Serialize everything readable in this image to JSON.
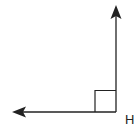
{
  "diagram": {
    "type": "right-angle",
    "vertex_label": "H",
    "vertex": [
      116,
      112
    ],
    "rays": [
      {
        "name": "up",
        "end": [
          116,
          5
        ]
      },
      {
        "name": "left",
        "end": [
          12,
          112
        ]
      }
    ],
    "right_angle_marker_size": 20,
    "stroke_color": "#222222"
  }
}
